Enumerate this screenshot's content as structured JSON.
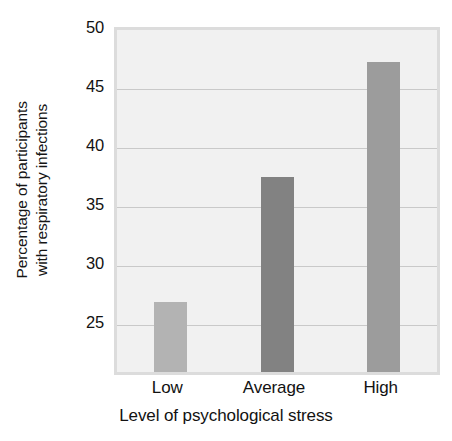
{
  "chart_data": {
    "type": "bar",
    "title": "",
    "subtitle": "",
    "categories": [
      "Low",
      "Average",
      "High"
    ],
    "values": [
      26.9,
      37.5,
      47.3
    ],
    "series": [
      {
        "name": "Percentage of participants with respiratory infections",
        "values": [
          26.9,
          37.5,
          47.3
        ]
      }
    ],
    "xlabel": "Level of psychological stress",
    "ylabel": "Percentage of participants with respiratory infections",
    "ylabel_lines": [
      "Percentage of participants",
      "with respiratory infections"
    ],
    "ylim": [
      21.0,
      50.0
    ],
    "yticks": [
      50,
      45,
      40,
      35,
      30,
      25
    ],
    "ytick_labels": [
      "50",
      "45",
      "40",
      "35",
      "30",
      "25"
    ],
    "grid": true,
    "grid_axis": "y",
    "legend": false,
    "legend_position": "none",
    "bar_colors": [
      "#b3b3b3",
      "#828282",
      "#9c9c9c"
    ],
    "plot_background": "#f1f1f1",
    "plot_border_color": "#dcdcdc",
    "gridline_color": "#c9c9c9",
    "text_color": "#121212",
    "figure_background": "#ffffff"
  }
}
